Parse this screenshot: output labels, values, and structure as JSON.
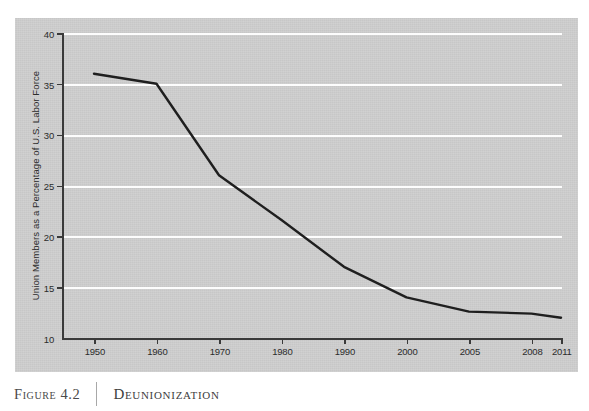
{
  "caption": {
    "figure_label": "Figure 4.2",
    "title": "Deunionization",
    "divider": "|"
  },
  "colors": {
    "panel_background": "#cecece",
    "gridline": "#fdfdfd",
    "axis": "#3a3a3a",
    "series_line": "#1f1f1f",
    "page_background": "#ffffff",
    "caption_text": "#3d3d3d"
  },
  "chart_data": {
    "type": "line",
    "title": "Deunionization",
    "xlabel": "",
    "ylabel": "Union Members as a Percentage of U.S. Labor Force",
    "categories": [
      "1950",
      "1960",
      "1970",
      "1980",
      "1990",
      "2000",
      "2005",
      "2008",
      "2011"
    ],
    "values": [
      36,
      35,
      26,
      21.6,
      17,
      14,
      12.6,
      12.4,
      12
    ],
    "series": [
      {
        "name": "Union membership rate",
        "values": [
          36,
          35,
          26,
          21.6,
          17,
          14,
          12.6,
          12.4,
          12
        ]
      }
    ],
    "ylim": [
      10,
      40
    ],
    "yticks": [
      10,
      15,
      20,
      25,
      30,
      35,
      40
    ],
    "ytick_labels": [
      "10",
      "15",
      "20",
      "25",
      "30",
      "35",
      "40"
    ],
    "xtick_labels": [
      "1950",
      "1960",
      "1970",
      "1980",
      "1990",
      "2000",
      "2005",
      "2008",
      "2011"
    ],
    "grid": "horizontal",
    "gridlines_at": [
      15,
      20,
      25,
      30,
      35,
      40
    ],
    "legend": "none",
    "legend_position": "none",
    "annotations": []
  }
}
